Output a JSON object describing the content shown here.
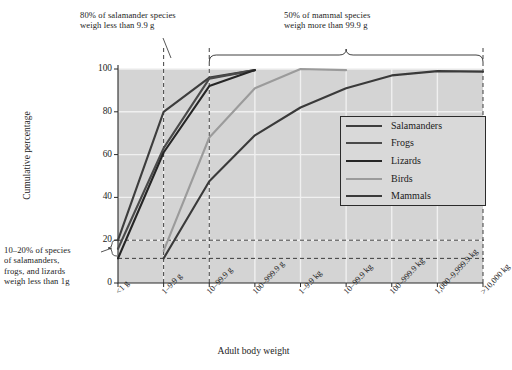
{
  "chart_data": {
    "type": "line",
    "title": "",
    "xlabel": "Adult body weight",
    "ylabel": "Cumulative percentage",
    "ylim": [
      0,
      100
    ],
    "yticks": [
      0,
      20,
      40,
      60,
      80,
      100
    ],
    "grid": true,
    "legend_position": "center-right",
    "categories": [
      "<1 g",
      "1–9.9 g",
      "10–99.9 g",
      "100–999.9 g",
      "1–9.9 kg",
      "10–99.9 kg",
      "100–999.9 kg",
      "1,000–9,999.9 kg",
      ">10,000 kg"
    ],
    "series": [
      {
        "name": "Salamanders",
        "color": "#3d3d3d",
        "values": [
          20,
          80,
          96,
          99.5,
          null,
          null,
          null,
          null,
          null
        ]
      },
      {
        "name": "Frogs",
        "color": "#4a4a4a",
        "values": [
          16,
          63,
          95.5,
          99.5,
          null,
          null,
          null,
          null,
          null
        ]
      },
      {
        "name": "Lizards",
        "color": "#262626",
        "values": [
          11.5,
          61,
          92,
          99.5,
          null,
          null,
          null,
          null,
          null
        ]
      },
      {
        "name": "Birds",
        "color": "#9b9b9b",
        "values": [
          null,
          15,
          68,
          91,
          100,
          99.5,
          null,
          null,
          null
        ]
      },
      {
        "name": "Mammals",
        "color": "#3a3a3a",
        "values": [
          null,
          11.5,
          47.5,
          69,
          82,
          91,
          97,
          99,
          98.8
        ]
      }
    ],
    "annotations": [
      {
        "id": "anno-salamander",
        "text": "80% of salamander species weigh less than 9.9 g",
        "lines": [
          "80% of salamander species",
          "weigh less than 9.9 g"
        ]
      },
      {
        "id": "anno-mammal",
        "text": "50% of mammal species weigh more than 99.9 g",
        "lines": [
          "50% of mammal species",
          "weigh more than 99.9 g"
        ]
      },
      {
        "id": "anno-small",
        "text": "10–20% of species of salamanders, frogs, and lizards weigh less than 1g",
        "lines": [
          "10–20% of species",
          "of salamanders,",
          "frogs, and lizards",
          "weigh less than 1g"
        ]
      }
    ],
    "reference_lines": {
      "horizontal": [
        20,
        11.5
      ],
      "vertical": [
        "1–9.9 g",
        "10–99.9 g",
        ">10,000 kg"
      ]
    },
    "colors": {
      "plot_background": "#d4d4d4",
      "grid": "#f0f0f0",
      "axis": "#2b2b2b",
      "text": "#1b1b1b"
    }
  },
  "annotation_salamander": {
    "line1": "80% of salamander species",
    "line2": "weigh less than 9.9 g"
  },
  "annotation_mammal": {
    "line1": "50% of mammal species",
    "line2": "weigh more than 99.9 g"
  },
  "annotation_small": {
    "line1": "10–20% of species",
    "line2": "of salamanders,",
    "line3": "frogs, and lizards",
    "line4": "weigh less than 1g"
  },
  "axis": {
    "x_title": "Adult body weight",
    "y_title": "Cumulative percentage"
  },
  "legend": {
    "items": [
      {
        "label": "Salamanders",
        "color": "#3d3d3d"
      },
      {
        "label": "Frogs",
        "color": "#4a4a4a"
      },
      {
        "label": "Lizards",
        "color": "#262626"
      },
      {
        "label": "Birds",
        "color": "#9b9b9b"
      },
      {
        "label": "Mammals",
        "color": "#3a3a3a"
      }
    ]
  }
}
